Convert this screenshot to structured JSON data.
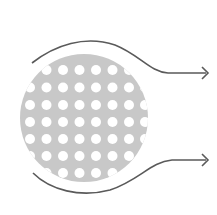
{
  "diagram": {
    "colors": {
      "background": "#ffffff",
      "body_fill": "#c8c8c8",
      "hole_fill": "#ffffff",
      "stroke": "#5a5a5a"
    },
    "body": {
      "cx": 84,
      "cy": 118,
      "r": 64
    },
    "holes": {
      "cols": [
        30,
        46.5,
        63,
        79.5,
        96,
        112.5,
        129,
        145
      ],
      "rows": [
        70,
        87.5,
        105,
        122,
        139,
        156,
        173
      ],
      "r": 5
    },
    "streamlines": [
      {
        "name": "top-streamline",
        "path": "M32,63 C55,45 85,35 115,45 C140,55 150,72 168,73 L206,73",
        "arrow_tip": [
          208,
          73
        ]
      },
      {
        "name": "bottom-streamline",
        "path": "M33,173 C50,190 80,198 110,190 C140,180 150,162 172,160 L206,160",
        "arrow_tip": [
          208,
          160
        ]
      }
    ]
  }
}
